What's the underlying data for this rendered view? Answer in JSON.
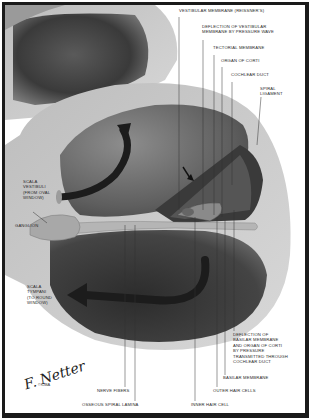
{
  "figure": {
    "signature": "F. Netter",
    "copyright": "©CIBA"
  },
  "labels": {
    "vestibular_membrane": "VESTIBULAR MEMBRANE (REISSNER'S)",
    "deflection_vestibular": "DEFLECTION OF VESTIBULAR\nMEMBRANE BY PRESSURE WAVE",
    "tectorial_membrane": "TECTORIAL MEMBRANE",
    "organ_of_corti": "ORGAN OF CORTI",
    "cochlear_duct": "COCHLEAR DUCT",
    "spiral_ligament": "SPIRAL\nLIGAMENT",
    "scala_vestibuli": "SCALA\nVESTIBULI\n(FROM OVAL\nWINDOW)",
    "ganglion": "GANGLION",
    "scala_tympani": "SCALA\nTYMPANI\n(TO ROUND\nWINDOW)",
    "deflection_basilar": "DEFLECTION OF\nBASILAR MEMBRANE\nAND ORGAN OF CORTI\nBY PRESSURE\nTRANSMITTED THROUGH\nCOCHLEAR DUCT",
    "basilar_membrane": "BASILAR MEMBRANE",
    "outer_hair_cells": "OUTER HAIR CELLS",
    "inner_hair_cell": "INNER HAIR CELL",
    "nerve_fibers": "NERVE FIBERS",
    "osseous_spiral_lamina": "OSSEOUS SPIRAL LAMINA"
  },
  "colors": {
    "frame": "#1a1a1a",
    "bone_light": "#c8c8c8",
    "cavity_dark": "#2e2e2e",
    "arrow": "#1c1c1c"
  }
}
